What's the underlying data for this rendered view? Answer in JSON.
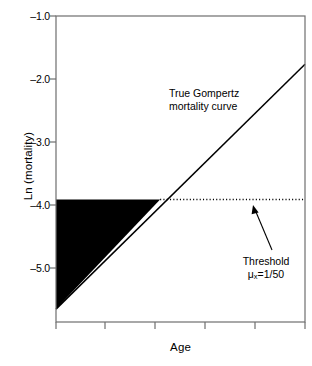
{
  "chart_data": {
    "type": "line",
    "title": "",
    "xlabel": "Age",
    "ylabel": "Ln (mortality)",
    "grid": false,
    "legend": "none",
    "xlim": [
      0,
      5
    ],
    "ylim": [
      -5.75,
      -1.0
    ],
    "yticks": [
      -1.0,
      -2.0,
      -3.0,
      -4.0,
      -5.0
    ],
    "ytick_labels": [
      "–1.0",
      "–2.0",
      "–3.0",
      "–4.0",
      "–5.0"
    ],
    "xticks": [
      0,
      1,
      2,
      3,
      4,
      5
    ],
    "xtick_labels": [
      "",
      "",
      "",
      "",
      "",
      ""
    ],
    "series": [
      {
        "name": "True Gompertz mortality curve",
        "type": "line",
        "x": [
          0,
          5
        ],
        "y": [
          -5.55,
          -1.75
        ],
        "color": "#000000",
        "width": 1.4,
        "style": "solid"
      },
      {
        "name": "Threshold",
        "type": "line",
        "x": [
          2.09,
          5
        ],
        "y": [
          -3.85,
          -3.85
        ],
        "color": "#000000",
        "width": 1.4,
        "style": "dotted"
      }
    ],
    "shaded_region": {
      "name": "Unobserved mortality below threshold",
      "color": "#000000",
      "vertices": [
        [
          0,
          -3.85
        ],
        [
          2.09,
          -3.85
        ],
        [
          0,
          -5.55
        ]
      ]
    },
    "annotations": [
      {
        "name": "gompertz-label",
        "line1": "True Gompertz",
        "line2": "mortality curve",
        "x": 2.25,
        "y": -2.35
      },
      {
        "name": "threshold-label",
        "line1": "Threshold",
        "line2_prefix": "μ",
        "line2_sub": "x",
        "line2_suffix": "=1/50",
        "x": 4.0,
        "y": -4.8,
        "arrow_to": [
          3.97,
          -3.88
        ]
      }
    ]
  },
  "axes": {
    "y_label": "Ln (mortality)",
    "x_label": "Age",
    "tick_labels_y": [
      "–1.0",
      "–2.0",
      "–3.0",
      "–4.0",
      "–5.0"
    ]
  },
  "annotations": {
    "gompertz_line1": "True Gompertz",
    "gompertz_line2": "mortality curve",
    "threshold_line1": "Threshold",
    "threshold_mu": "μ",
    "threshold_sub": "x",
    "threshold_rest": "=1/50"
  },
  "colors": {
    "foreground": "#000000",
    "background": "#ffffff",
    "frame": "#6e6e6e"
  }
}
